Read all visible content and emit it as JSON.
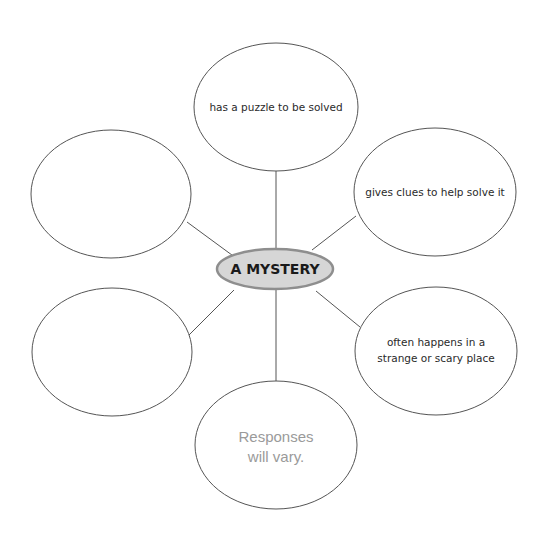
{
  "center": {
    "label": "A MYSTERY"
  },
  "nodes": {
    "top": {
      "lines": [
        "has a puzzle to be solved"
      ]
    },
    "top_right": {
      "lines": [
        "gives clues to help solve it"
      ]
    },
    "bottom_right": {
      "lines": [
        "often happens in a",
        "strange or scary place"
      ]
    },
    "bottom": {
      "lines": [
        "Responses",
        "will vary."
      ]
    },
    "bottom_left": {
      "lines": []
    },
    "top_left": {
      "lines": []
    }
  },
  "colors": {
    "hub_fill": "#d6d6d6",
    "hub_stroke": "#8e8e8e",
    "line": "#555555",
    "response_text": "#9a9a9a"
  }
}
